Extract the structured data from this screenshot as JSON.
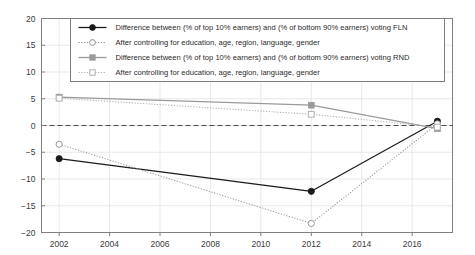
{
  "chart_data": {
    "type": "line",
    "title": "",
    "xlabel": "",
    "ylabel": "",
    "xlim": [
      2001.3,
      2017.6
    ],
    "ylim": [
      -20,
      20
    ],
    "grid": true,
    "legend_position": "top-center",
    "xticks": [
      "2002",
      "2004",
      "2006",
      "2008",
      "2010",
      "2012",
      "2014",
      "2016"
    ],
    "xtick_values": [
      2002,
      2004,
      2006,
      2008,
      2010,
      2012,
      2014,
      2016
    ],
    "yticks": [
      "20",
      "15",
      "10",
      "5",
      "0",
      "−5",
      "−10",
      "−15",
      "−20"
    ],
    "ytick_values": [
      20,
      15,
      10,
      5,
      0,
      -5,
      -10,
      -15,
      -20
    ],
    "zero_reference_line": 0,
    "x": [
      2002,
      2012,
      2017
    ],
    "series": [
      {
        "name": "Difference between (% of top 10% earners) and (% of bottom 90% earners) voting FLN",
        "key": "fln_raw",
        "color": "#1a1a1a",
        "style": "solid",
        "marker": "filled-circle",
        "values": [
          -6.2,
          -12.3,
          0.8
        ]
      },
      {
        "name": "After controlling for education, age, region, language, gender",
        "key": "fln_controlled",
        "color": "#9a9a9a",
        "style": "dotted",
        "marker": "open-circle",
        "values": [
          -3.5,
          -18.3,
          0.3
        ]
      },
      {
        "name": "Difference between (% of top 10% earners) and (% of bottom 90% earners) voting RND",
        "key": "rnd_raw",
        "color": "#9a9a9a",
        "style": "solid",
        "marker": "filled-square",
        "values": [
          5.3,
          3.8,
          -0.6
        ]
      },
      {
        "name": "After controlling for education, age, region, language, gender",
        "key": "rnd_controlled",
        "color": "#b0b0b0",
        "style": "dotted",
        "marker": "open-square",
        "values": [
          5.1,
          2.1,
          -0.3
        ]
      }
    ],
    "legend": [
      {
        "label": "Difference between (% of top 10% earners) and (% of bottom 90% earners) voting FLN",
        "marker": "filled-circle",
        "style": "solid",
        "color": "#1a1a1a"
      },
      {
        "label": "After controlling for education, age, region, language, gender",
        "marker": "open-circle",
        "style": "dotted",
        "color": "#8f8f8f"
      },
      {
        "label": "Difference between (% of top 10% earners) and (% of bottom 90% earners) voting RND",
        "marker": "filled-square",
        "style": "solid",
        "color": "#9a9a9a"
      },
      {
        "label": "After controlling for education, age, region, language, gender",
        "marker": "open-square",
        "style": "dotted",
        "color": "#b0b0b0"
      }
    ]
  },
  "colors": {
    "background": "#ffffff",
    "axis": "#808080",
    "grid": "#e3e3e3",
    "text": "#2b2b2b",
    "black_series": "#1a1a1a",
    "gray_series": "#9a9a9a"
  }
}
